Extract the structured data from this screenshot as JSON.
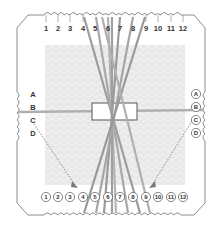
{
  "diagram": {
    "colors": {
      "outline": "#8a8a8a",
      "pattern_bg": "#ececec",
      "thread": "#9a9a9a",
      "thread_light": "#b8b8b8",
      "label": "#333333",
      "arrow": "#7a7a7a"
    },
    "top_labels": [
      "1",
      "2",
      "3",
      "4",
      "5",
      "6",
      "7",
      "8",
      "9",
      "10",
      "11",
      "12"
    ],
    "bottom_labels": [
      "1",
      "2",
      "3",
      "4",
      "5",
      "6",
      "7",
      "8",
      "9",
      "10",
      "11",
      "12"
    ],
    "left_labels": [
      "A",
      "B",
      "C",
      "D"
    ],
    "right_labels": [
      "A",
      "B",
      "C",
      "D"
    ],
    "center_box": "center-window"
  }
}
